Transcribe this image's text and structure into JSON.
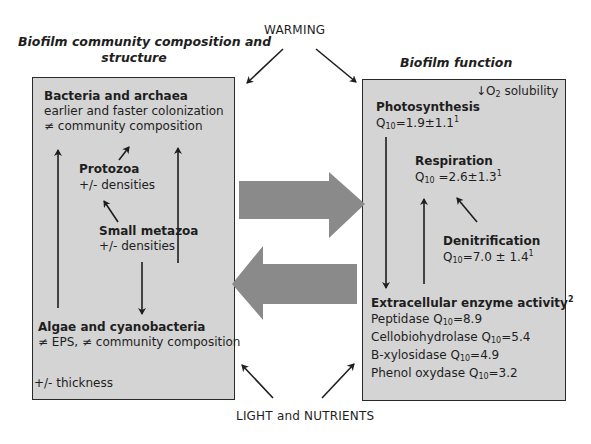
{
  "drivers": {
    "top": "WARMING",
    "bottom": "LIGHT and NUTRIENTS"
  },
  "left_panel": {
    "title_line1": "Biofilm community composition and",
    "title_line2": "structure",
    "bacteria": {
      "name": "Bacteria and archaea",
      "line1": "earlier and faster colonization",
      "line2": "≠ community composition"
    },
    "protozoa": {
      "name": "Protozoa",
      "effect": "+/- densities"
    },
    "metazoa": {
      "name": "Small metazoa",
      "effect": "+/- densities"
    },
    "algae": {
      "name": "Algae and cyanobacteria",
      "line1": "≠ EPS, ≠ community composition"
    },
    "thickness": "+/- thickness"
  },
  "right_panel": {
    "title": "Biofilm function",
    "o2": {
      "arrow": "↓",
      "species": "O",
      "sub": "2",
      "text": " solubility"
    },
    "photosynthesis": {
      "name": "Photosynthesis",
      "q": "Q",
      "q_sub": "10",
      "value": "=1.9±1.1",
      "ref": "1"
    },
    "respiration": {
      "name": "Respiration",
      "q": "Q",
      "q_sub": "10",
      "value": " =2.6±1.3",
      "ref": "1"
    },
    "denitrification": {
      "name": "Denitrification",
      "q": "Q",
      "q_sub": "10",
      "value": "=7.0 ± 1.4",
      "ref": "1"
    },
    "enzymes": {
      "title": "Extracellular enzyme activity",
      "ref": "2",
      "items": [
        {
          "name": "Peptidase ",
          "q": "Q",
          "q_sub": "10",
          "value": "=8.9"
        },
        {
          "name": "Cellobiohydrolase ",
          "q": "Q",
          "q_sub": "10",
          "value": "=5.4"
        },
        {
          "name": "Β-xylosidase ",
          "q": "Q",
          "q_sub": "10",
          "value": "=4.9"
        },
        {
          "name": "Phenol oxydase ",
          "q": "Q",
          "q_sub": "10",
          "value": "=3.2"
        }
      ]
    }
  },
  "colors": {
    "box_fill": "#d4d4d4",
    "box_border": "#2a2a2a",
    "big_arrow": "#8a8a8a",
    "line": "#1e1e1e"
  }
}
